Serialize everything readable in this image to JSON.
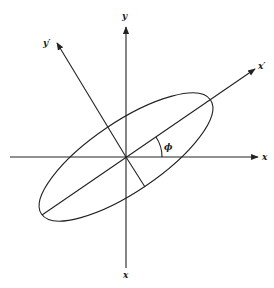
{
  "diagram": {
    "labels": {
      "x_axis": "x",
      "y_axis": "y",
      "x_prime": "x′",
      "y_prime": "y′",
      "bottom_axis": "x",
      "angle": "ϕ"
    },
    "geometry": {
      "center": [
        126,
        157
      ],
      "rotation_deg": -34,
      "semi_major": 102,
      "semi_minor": 35
    },
    "colors": {
      "stroke": "#222222",
      "background": "#ffffff"
    }
  }
}
